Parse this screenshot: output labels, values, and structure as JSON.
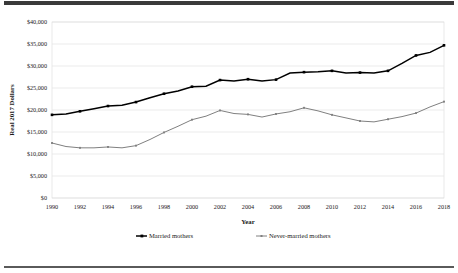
{
  "figure": {
    "background_color": "#ffffff",
    "frame_top_color": "#3a3a3a",
    "frame_bottom_color": "#5a5a5a"
  },
  "chart_data": {
    "type": "line",
    "title": "",
    "xlabel": "Year",
    "ylabel": "Real 2017 Dollars",
    "xlim": [
      1990,
      2018
    ],
    "ylim": [
      0,
      40000
    ],
    "grid": true,
    "grid_axis": "y",
    "legend_position": "bottom",
    "y_ticks": [
      0,
      5000,
      10000,
      15000,
      20000,
      25000,
      30000,
      35000,
      40000
    ],
    "y_tick_labels": [
      "$0",
      "$5,000",
      "$10,000",
      "$15,000",
      "$20,000",
      "$25,000",
      "$30,000",
      "$35,000",
      "$40,000"
    ],
    "x_ticks": [
      1990,
      1992,
      1994,
      1996,
      1998,
      2000,
      2002,
      2004,
      2006,
      2008,
      2010,
      2012,
      2014,
      2016,
      2018
    ],
    "x_tick_labels": [
      "1990",
      "1992",
      "1994",
      "1996",
      "1998",
      "2000",
      "2002",
      "2004",
      "2006",
      "2008",
      "2010",
      "2012",
      "2014",
      "2016",
      "2018"
    ],
    "x": [
      1990,
      1991,
      1992,
      1993,
      1994,
      1995,
      1996,
      1997,
      1998,
      1999,
      2000,
      2001,
      2002,
      2003,
      2004,
      2005,
      2006,
      2007,
      2008,
      2009,
      2010,
      2011,
      2012,
      2013,
      2014,
      2015,
      2016,
      2017,
      2018
    ],
    "series": [
      {
        "name": "Married mothers",
        "color": "#000000",
        "marker": "square",
        "values": [
          18900,
          19100,
          19700,
          20300,
          20900,
          21100,
          21800,
          22800,
          23700,
          24300,
          25300,
          25400,
          26800,
          26600,
          27000,
          26600,
          26900,
          28400,
          28600,
          28700,
          28900,
          28400,
          28500,
          28400,
          28900,
          30600,
          32400,
          33100,
          34700
        ]
      },
      {
        "name": "Never-married mothers",
        "color": "#808080",
        "marker": "square",
        "values": [
          12500,
          11700,
          11400,
          11400,
          11600,
          11400,
          11900,
          13300,
          14900,
          16300,
          17800,
          18600,
          19900,
          19200,
          19000,
          18400,
          19100,
          19600,
          20500,
          19800,
          18900,
          18200,
          17500,
          17300,
          17900,
          18500,
          19300,
          20700,
          21900
        ]
      }
    ]
  },
  "legend": {
    "items": [
      {
        "label": "Married mothers",
        "color": "#000000"
      },
      {
        "label": "Never-married mothers",
        "color": "#808080"
      }
    ]
  }
}
